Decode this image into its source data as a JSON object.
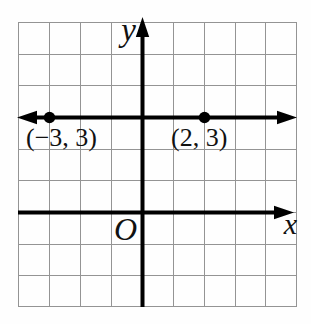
{
  "figure": {
    "type": "coordinate-grid-diagram",
    "axis_labels": {
      "y": "y",
      "x": "x",
      "origin": "O"
    },
    "line_y3": {
      "y_value": 3,
      "points": [
        {
          "label": "(−3, 3)",
          "x": -3,
          "y": 3
        },
        {
          "label": "(2, 3)",
          "x": 2,
          "y": 3
        }
      ]
    },
    "grid": {
      "columns": 9,
      "rows": 9,
      "units_left_of_y_axis": 4,
      "units_right_of_y_axis": 5,
      "units_above_x_axis": 6,
      "units_below_x_axis": 3
    },
    "colors": {
      "axis": "#000000",
      "grid_line": "#949494",
      "background": "#ffffff",
      "point_fill": "#000000"
    }
  }
}
